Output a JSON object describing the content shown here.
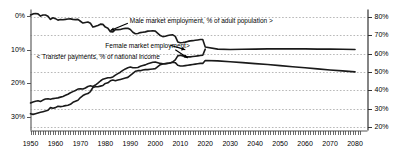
{
  "chart_data": {
    "type": "line",
    "title": "",
    "subtitle": "",
    "xlabel": "",
    "ylabel_left": "Transfer payments, % of national income",
    "ylabel_right": "Market employment, % of adult population",
    "grid": true,
    "legend_position": "inline-annotations",
    "xlim": [
      1950,
      2085
    ],
    "ylim_left": [
      34,
      -2
    ],
    "ylim_right": [
      18,
      84
    ],
    "left_axis_inverted": true,
    "xticks": [
      1950,
      1960,
      1970,
      1980,
      1990,
      2000,
      2010,
      2020,
      2030,
      2040,
      2050,
      2060,
      2070,
      2080
    ],
    "xtick_labels": [
      "1950",
      "1960",
      "1970",
      "1980",
      "1990",
      "2000",
      "2010",
      "2020",
      "2030",
      "2040",
      "2050",
      "2060",
      "2070",
      "2080"
    ],
    "yticks_left": [
      0,
      10,
      20,
      30
    ],
    "ytick_labels_left": [
      "0%",
      "10%",
      "20%",
      "30%"
    ],
    "yticks_right": [
      20,
      30,
      40,
      50,
      60,
      70,
      80
    ],
    "ytick_labels_right": [
      "20%",
      "30%",
      "40%",
      "50%",
      "60%",
      "70%",
      "80%"
    ],
    "annotations": [
      {
        "text": "Male market employment, % of adult population >",
        "x": 1990,
        "y_right": 77,
        "align": "right-arrow"
      },
      {
        "text": "< Transfer payments, % of national income",
        "x": 1957,
        "y_left": 12.4,
        "align": "left-arrow"
      },
      {
        "text": "Female market employment>",
        "x": 1986,
        "y_right": 63.5,
        "align": "right-arrow"
      }
    ],
    "series": [
      {
        "name": "Male market employment, % of adult population",
        "axis": "right",
        "color": "#1a1a1a",
        "linewidth": 1.6,
        "x": [
          1950,
          1951,
          1952,
          1953,
          1954,
          1955,
          1956,
          1957,
          1958,
          1959,
          1960,
          1961,
          1962,
          1963,
          1964,
          1965,
          1966,
          1967,
          1968,
          1969,
          1970,
          1971,
          1972,
          1973,
          1974,
          1975,
          1976,
          1977,
          1978,
          1979,
          1980,
          1981,
          1982,
          1983,
          1984,
          1985,
          1986,
          1987,
          1988,
          1989,
          1990,
          1991,
          1992,
          1993,
          1994,
          1995,
          1996,
          1997,
          1998,
          1999,
          2000,
          2001,
          2002,
          2003,
          2004,
          2005,
          2006,
          2007,
          2008,
          2009,
          2010,
          2011,
          2012,
          2013,
          2014,
          2015,
          2016,
          2017,
          2018,
          2019,
          2020,
          2025,
          2030,
          2035,
          2040,
          2045,
          2050,
          2055,
          2060,
          2065,
          2070,
          2075,
          2080
        ],
        "values": [
          81.0,
          81.6,
          81.8,
          81.6,
          80.4,
          81.0,
          81.0,
          80.3,
          78.6,
          79.5,
          79.0,
          78.2,
          78.5,
          78.4,
          78.6,
          78.8,
          78.9,
          78.6,
          78.5,
          78.6,
          77.6,
          76.6,
          76.9,
          77.2,
          76.5,
          74.4,
          74.8,
          75.3,
          76.0,
          75.9,
          74.4,
          73.8,
          71.9,
          71.8,
          73.0,
          73.0,
          73.1,
          73.5,
          73.7,
          73.8,
          73.1,
          71.6,
          70.8,
          70.9,
          71.4,
          71.6,
          71.8,
          72.2,
          72.3,
          72.4,
          72.2,
          71.0,
          69.8,
          69.2,
          69.4,
          69.8,
          70.1,
          70.2,
          69.3,
          66.3,
          65.9,
          66.0,
          66.2,
          66.6,
          66.9,
          67.0,
          67.2,
          67.4,
          67.6,
          67.6,
          63.5,
          62.4,
          62.2,
          62.3,
          62.4,
          62.5,
          62.5,
          62.5,
          62.5,
          62.4,
          62.4,
          62.3,
          62.2
        ]
      },
      {
        "name": "Female market employment",
        "axis": "right",
        "color": "#1a1a1a",
        "linewidth": 1.6,
        "x": [
          1950,
          1951,
          1952,
          1953,
          1954,
          1955,
          1956,
          1957,
          1958,
          1959,
          1960,
          1961,
          1962,
          1963,
          1964,
          1965,
          1966,
          1967,
          1968,
          1969,
          1970,
          1971,
          1972,
          1973,
          1974,
          1975,
          1976,
          1977,
          1978,
          1979,
          1980,
          1981,
          1982,
          1983,
          1984,
          1985,
          1986,
          1987,
          1988,
          1989,
          1990,
          1991,
          1992,
          1993,
          1994,
          1995,
          1996,
          1997,
          1998,
          1999,
          2000,
          2001,
          2002,
          2003,
          2004,
          2005,
          2006,
          2007,
          2008,
          2009,
          2010,
          2011,
          2012,
          2013,
          2014,
          2015,
          2016,
          2017,
          2018,
          2019,
          2020,
          2025,
          2030,
          2035,
          2040,
          2045,
          2050,
          2055,
          2060,
          2065,
          2070,
          2075,
          2080
        ],
        "values": [
          33.0,
          33.6,
          34.0,
          34.2,
          33.8,
          34.6,
          35.2,
          35.3,
          35.0,
          35.4,
          35.6,
          35.8,
          36.2,
          36.6,
          37.2,
          37.8,
          38.6,
          39.2,
          39.8,
          40.6,
          40.8,
          40.6,
          41.2,
          42.0,
          42.4,
          42.0,
          42.8,
          43.8,
          45.0,
          46.0,
          46.4,
          46.8,
          46.8,
          47.2,
          48.2,
          49.0,
          49.8,
          50.8,
          51.6,
          52.2,
          52.6,
          52.2,
          52.2,
          52.4,
          53.0,
          53.4,
          53.8,
          54.4,
          54.8,
          55.2,
          55.4,
          55.0,
          54.6,
          54.4,
          54.4,
          54.6,
          55.0,
          55.2,
          55.0,
          53.6,
          53.2,
          53.2,
          53.4,
          53.6,
          53.8,
          54.0,
          54.2,
          54.4,
          54.6,
          54.6,
          56.2,
          56.0,
          55.5,
          55.0,
          54.5,
          54.0,
          53.4,
          52.8,
          52.2,
          51.6,
          51.0,
          50.5,
          50.0
        ]
      },
      {
        "name": "Transfer payments, % of national income",
        "axis": "left",
        "color": "#1a1a1a",
        "linewidth": 1.6,
        "x": [
          1950,
          1951,
          1952,
          1953,
          1954,
          1955,
          1956,
          1957,
          1958,
          1959,
          1960,
          1961,
          1962,
          1963,
          1964,
          1965,
          1966,
          1967,
          1968,
          1969,
          1970,
          1971,
          1972,
          1973,
          1974,
          1975,
          1976,
          1977,
          1978,
          1979,
          1980,
          1981,
          1982,
          1983,
          1984,
          1985,
          1986,
          1987,
          1988,
          1989,
          1990,
          1991,
          1992,
          1993,
          1994,
          1995,
          1996,
          1997,
          1998,
          1999,
          2000,
          2001,
          2002,
          2003,
          2004,
          2005,
          2006,
          2007,
          2008,
          2009,
          2010,
          2011,
          2012,
          2013,
          2014,
          2015,
          2016,
          2017,
          2018,
          2019,
          2020
        ],
        "values": [
          29.0,
          29.2,
          29.0,
          28.8,
          28.6,
          28.4,
          28.2,
          28.0,
          27.2,
          27.4,
          27.2,
          26.8,
          26.9,
          26.8,
          26.6,
          26.5,
          26.2,
          25.6,
          25.3,
          25.0,
          24.2,
          23.6,
          23.2,
          23.0,
          22.4,
          21.2,
          21.0,
          21.0,
          20.8,
          20.6,
          20.0,
          19.8,
          19.2,
          19.0,
          19.2,
          19.0,
          18.8,
          18.6,
          18.4,
          18.2,
          17.6,
          17.0,
          16.4,
          16.2,
          16.2,
          16.0,
          15.9,
          15.9,
          15.8,
          15.7,
          15.6,
          15.0,
          14.4,
          14.2,
          14.1,
          14.0,
          13.9,
          13.6,
          13.0,
          11.8,
          11.6,
          11.8,
          12.0,
          12.1,
          12.1,
          12.0,
          11.9,
          11.8,
          11.7,
          11.6,
          9.8
        ]
      }
    ]
  }
}
